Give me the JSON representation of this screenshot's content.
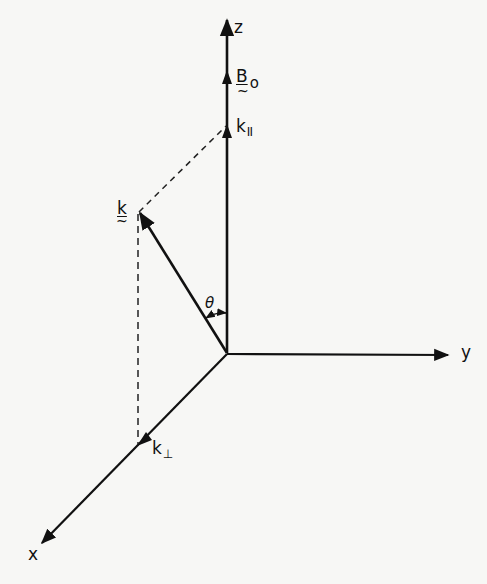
{
  "diagram": {
    "type": "3d-coordinate-vector-diagram",
    "axes": {
      "z": "z",
      "y": "y",
      "x": "x"
    },
    "vectors": {
      "field": {
        "symbol": "B",
        "subscript": "o",
        "tilde": "~"
      },
      "wave": {
        "symbol": "k",
        "tilde": "~"
      },
      "parallel": {
        "symbol": "k",
        "subscript": "II"
      },
      "perpendicular": {
        "symbol": "k",
        "subscript": "⊥"
      }
    },
    "angle": {
      "symbol": "θ"
    },
    "colors": {
      "ink": "#111111",
      "background": "#f7f7f5"
    }
  }
}
